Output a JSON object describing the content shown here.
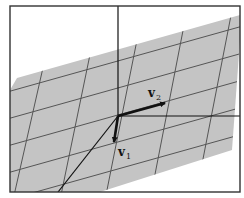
{
  "figure": {
    "type": "linear-span-plane",
    "colors": {
      "plane": "#c4c4c4",
      "grid": "#555555",
      "axis": "#111111",
      "frame": "#333333",
      "background": "#ffffff"
    },
    "vectors": [
      {
        "name": "v1",
        "label": "v",
        "subscript": "1"
      },
      {
        "name": "v2",
        "label": "v",
        "subscript": "2"
      }
    ]
  }
}
